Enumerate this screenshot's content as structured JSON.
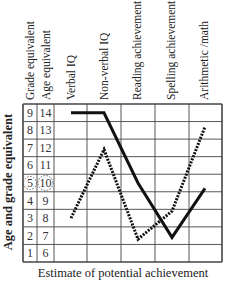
{
  "chart_data": {
    "type": "line",
    "title": "",
    "xlabel": "Estimate of potential achievement",
    "ylabel": "Age and grade equivalent",
    "categories": [
      "Verbal IQ",
      "Non-verbal IQ",
      "Reading achievement",
      "Spelling achievement",
      "Arithmetic /math"
    ],
    "index_columns": {
      "grade_header": "Grade equivalent",
      "age_header": "Age equivalent",
      "grade_values": [
        9,
        8,
        7,
        6,
        5,
        4,
        3,
        2,
        1
      ],
      "age_values": [
        14,
        13,
        12,
        11,
        10,
        9,
        8,
        7,
        6
      ],
      "circled_row": {
        "grade": 5,
        "age": 10
      }
    },
    "series": [
      {
        "name": "solid",
        "style": "solid",
        "values": [
          9,
          9,
          5,
          1.9,
          4.7
        ]
      },
      {
        "name": "dotted",
        "style": "dotted",
        "values": [
          3,
          6.9,
          1.8,
          3.4,
          8.2
        ]
      }
    ],
    "ylim": [
      1,
      9
    ],
    "grid": true,
    "legend": "none"
  },
  "headers": {
    "grade": "Grade equivalent",
    "age": "Age equivalent",
    "c0": "Verbal IQ",
    "c1": "Non-verbal IQ",
    "c2": "Reading achievement",
    "c3": "Spelling achievement",
    "c4": "Arithmetic /math"
  },
  "axis": {
    "x": "Estimate of potential achievement",
    "y": "Age and grade equivalent"
  }
}
